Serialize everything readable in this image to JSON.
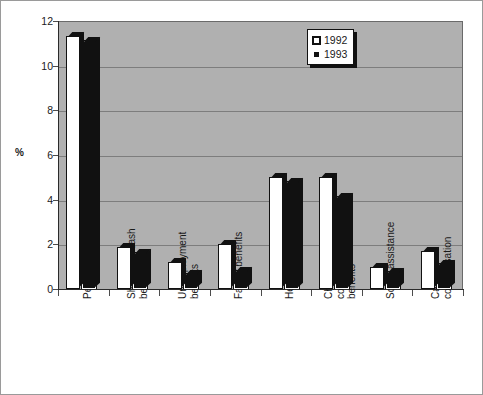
{
  "chart_data": {
    "type": "bar",
    "title": "",
    "subtitle": "",
    "xlabel": "",
    "ylabel": "%",
    "ylim": [
      0,
      12
    ],
    "yticks": [
      0,
      2,
      4,
      6,
      8,
      10,
      12
    ],
    "ytick_labels": [
      "0",
      "2",
      "4",
      "6",
      "8",
      "10",
      "12"
    ],
    "grid": true,
    "legend_position": "top-right",
    "categories": [
      "Pensions",
      "Short term cash benefits",
      "Unemployment benefits",
      "Family benefits",
      "Health benefits",
      "Chernobyl compensation benefits",
      "Social assistance",
      "Cash compensation"
    ],
    "category_lines": [
      [
        "Pensions"
      ],
      [
        "Short term cash",
        "benefits"
      ],
      [
        "Unemployment",
        "benefits"
      ],
      [
        "Family benefits"
      ],
      [
        "Health benefits"
      ],
      [
        "Chernobyl",
        "compensation",
        "benefits"
      ],
      [
        "Social assistance"
      ],
      [
        "Cash",
        "compensation"
      ]
    ],
    "series": [
      {
        "name": "1992",
        "marker": "hollow-square",
        "color": "#ffffff",
        "values": [
          11.35,
          1.9,
          1.2,
          2.0,
          5.0,
          5.0,
          1.0,
          1.7
        ]
      },
      {
        "name": "1993",
        "marker": "filled-square",
        "color": "#111111",
        "values": [
          11.1,
          1.6,
          0.65,
          0.8,
          4.8,
          4.1,
          0.75,
          1.1
        ]
      }
    ]
  },
  "legend": {
    "entries": [
      {
        "label": "1992"
      },
      {
        "label": "1993"
      }
    ]
  },
  "colors": {
    "plot_background": "#b0b0b0",
    "gridline": "#7d7d7d",
    "axis": "#2b2b2b",
    "series_1992": "#ffffff",
    "series_1993": "#111111",
    "text": "#1a1a1a"
  }
}
